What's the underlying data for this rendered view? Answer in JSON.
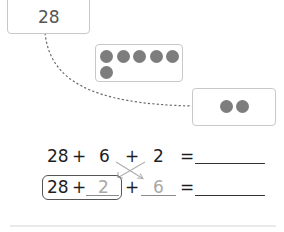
{
  "number_card": {
    "value": "28"
  },
  "ten_frame_card": {
    "dot_count": 6,
    "dot_color": "#7d7d7d"
  },
  "small_card": {
    "dot_count": 2
  },
  "equation_row_1": {
    "term1": "28",
    "op1": "+",
    "term2": "6",
    "op2": "+",
    "term3": "2",
    "equals": "=",
    "answer": ""
  },
  "equation_row_2": {
    "term1": "28",
    "op1": "+",
    "term2_filled": "2",
    "op2": "+",
    "term3_filled": "6",
    "equals": "=",
    "answer": ""
  },
  "colors": {
    "card_border": "#c8c8c8",
    "text_dark": "#1e1e1e",
    "text_hint": "#a8a8a8",
    "dot": "#7d7d7d"
  }
}
